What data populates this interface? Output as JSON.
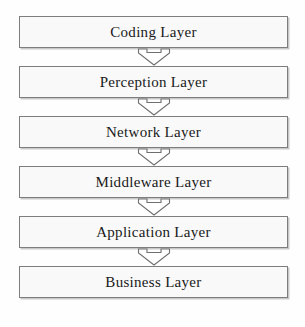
{
  "diagram": {
    "type": "vertical-flow",
    "background_color": "#fefefe",
    "box_fill_color": "#f9f9f9",
    "box_border_color": "#7d7d7d",
    "text_color": "#1a1a1a",
    "arrow_fill_color": "#ffffff",
    "arrow_stroke_color": "#6f6f6f",
    "arrow_icon_name": "hollow-down-arrow-icon",
    "layers": [
      {
        "label": "Coding Layer"
      },
      {
        "label": "Perception Layer"
      },
      {
        "label": "Network Layer"
      },
      {
        "label": "Middleware Layer"
      },
      {
        "label": "Application  Layer"
      },
      {
        "label": "Business Layer"
      }
    ],
    "connectors": [
      {
        "from": "Coding Layer",
        "to": "Perception Layer",
        "direction": "down"
      },
      {
        "from": "Perception Layer",
        "to": "Network Layer",
        "direction": "down"
      },
      {
        "from": "Network Layer",
        "to": "Middleware Layer",
        "direction": "down"
      },
      {
        "from": "Middleware Layer",
        "to": "Application  Layer",
        "direction": "down"
      },
      {
        "from": "Application  Layer",
        "to": "Business Layer",
        "direction": "down"
      }
    ]
  }
}
